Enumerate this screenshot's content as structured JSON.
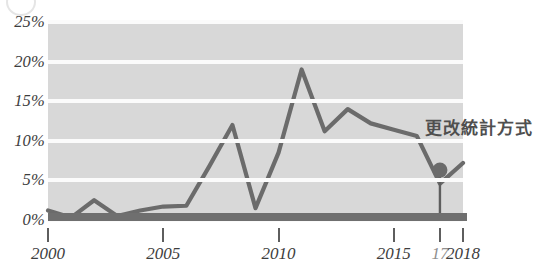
{
  "chart_data": {
    "type": "line",
    "title": "",
    "subtitle": "",
    "xlabel": "",
    "ylabel": "",
    "xlim": [
      2000,
      2018
    ],
    "ylim": [
      0,
      25
    ],
    "grid": true,
    "legend_position": "none",
    "y_ticks": [
      "0%",
      "5%",
      "10%",
      "15%",
      "20%",
      "25%"
    ],
    "y_tick_values": [
      0,
      5,
      10,
      15,
      20,
      25
    ],
    "x_ticks": [
      "2000",
      "2005",
      "2010",
      "2015",
      "17",
      "2018"
    ],
    "x_tick_values": [
      2000,
      2005,
      2010,
      2015,
      2017,
      2018
    ],
    "x": [
      2000,
      2001,
      2002,
      2003,
      2004,
      2005,
      2006,
      2007,
      2008,
      2009,
      2010,
      2011,
      2012,
      2013,
      2014,
      2015,
      2016,
      2017,
      2018
    ],
    "series": [
      {
        "name": "",
        "values": [
          1.2,
          0.3,
          2.5,
          0.5,
          1.2,
          1.7,
          1.8,
          6.8,
          12.0,
          1.5,
          8.5,
          19.0,
          11.2,
          14.0,
          12.2,
          11.4,
          10.6,
          4.6,
          7.2
        ]
      }
    ],
    "markers": [
      {
        "x": 2017,
        "y": 6.3,
        "label": "更改統計方式",
        "callout": "vertical-line-to-axis"
      }
    ],
    "colors": {
      "plot_background": "#d8d8d8",
      "gridline": "#fbfbfb",
      "line": "#6b6b6b",
      "baseline": "#6f6f6f",
      "axis_text": "#3d3d3d",
      "muted_axis_text": "#8f8f8f",
      "annotation_text": "#4f4f4f",
      "marker": "#6b6b6b"
    }
  },
  "annotation": {
    "text": "更改統計方式"
  },
  "icons": {
    "page_artifact": "circle-outline-icon"
  }
}
